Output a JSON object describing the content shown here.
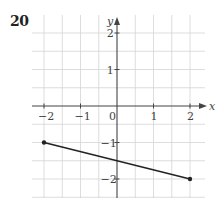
{
  "problem": {
    "number": "20"
  },
  "chart_data": {
    "type": "line",
    "title": "",
    "xlabel": "x",
    "ylabel": "y",
    "xlim": [
      -2.2,
      2.4
    ],
    "ylim": [
      -2.5,
      2.2
    ],
    "grid": true,
    "grid_step": 0.5,
    "x_ticks": [
      -2,
      -1,
      0,
      1,
      2
    ],
    "x_tick_labels": [
      "−2",
      "−1",
      "0",
      "1",
      "2"
    ],
    "y_ticks": [
      2,
      1,
      -1,
      -2
    ],
    "y_tick_labels": [
      "2",
      "1",
      "−1",
      "−2"
    ],
    "series": [
      {
        "name": "segment",
        "points": [
          [
            -2,
            -1
          ],
          [
            2,
            -2
          ]
        ],
        "endpoints": "closed-dots",
        "color": "#222222"
      }
    ],
    "annotations": {
      "y_intercept": -1.5
    }
  },
  "colors": {
    "grid": "#d4d4d4",
    "axis": "#444444",
    "line": "#222222"
  }
}
